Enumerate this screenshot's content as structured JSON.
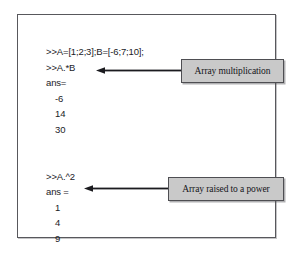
{
  "figure": {
    "console": {
      "block_one": [
        ">>A=[1;2;3];B=[-6;7;10];",
        ">>A.*B",
        "ans=",
        "-6",
        "14",
        "30"
      ],
      "block_two": [
        ">>A.^2",
        "ans =",
        "1",
        "4",
        "9"
      ]
    },
    "callouts": [
      {
        "label": "Array multiplication"
      },
      {
        "label": "Array raised to a power"
      }
    ],
    "colors": {
      "frame_border": "#58585c",
      "callout_fill": "#c9c9c9",
      "callout_border": "#4e4e52",
      "text": "#1b1b1f",
      "arrow": "#1b1b1f",
      "background": "#ffffff"
    }
  }
}
